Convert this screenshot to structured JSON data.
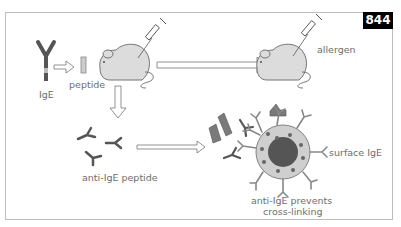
{
  "figure": {
    "number": "844",
    "labels": {
      "ige": "IgE",
      "peptide": "peptide",
      "allergen": "allergen",
      "anti_ige_peptide": "anti-IgE peptide",
      "surface_ige": "surface IgE",
      "prevents_line1": "anti-IgE prevents",
      "prevents_line2": "cross-linking"
    },
    "colors": {
      "antibody": "#555555",
      "mouse_fill": "#dcdcdc",
      "cell_fill": "#cfcfcf",
      "nucleus": "#555555",
      "badge_bg": "#000000",
      "arrow_fill": "#ffffff",
      "text": "#6e6e6e"
    }
  }
}
